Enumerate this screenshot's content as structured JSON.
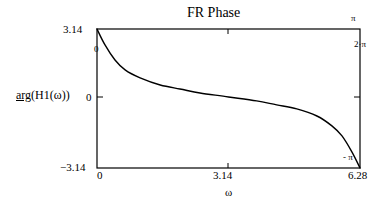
{
  "chart_data": {
    "type": "line",
    "title": "FR Phase",
    "xlabel": "ω",
    "ylabel_fn": "arg",
    "ylabel_arg": "(H1(ω))",
    "xlim": [
      0,
      6.28
    ],
    "ylim": [
      -3.14,
      3.14
    ],
    "grid": false,
    "x_ticks": [
      "0",
      "3.14",
      "6.28"
    ],
    "y_ticks": [
      "3.14",
      "0",
      "-3.14"
    ],
    "markers": {
      "top_right": "π",
      "right_upper": "2·π",
      "left_upper": "0",
      "bottom_right": "- π"
    },
    "series": [
      {
        "name": "arg(H1(ω))",
        "x": [
          0,
          0.19,
          0.43,
          0.67,
          1.03,
          1.51,
          1.98,
          2.46,
          3.14,
          3.81,
          4.29,
          4.77,
          5.25,
          5.61,
          5.85,
          6.09,
          6.28
        ],
        "y": [
          3.14,
          2.42,
          1.74,
          1.29,
          0.93,
          0.61,
          0.43,
          0.25,
          0.07,
          -0.11,
          -0.29,
          -0.47,
          -0.79,
          -1.24,
          -1.69,
          -2.42,
          -3.14
        ]
      }
    ]
  },
  "labels": {
    "title": "FR Phase",
    "y_top": "3.14",
    "y_zero": "0",
    "y_bottom": "−3.14",
    "x_left": "0",
    "x_mid": "3.14",
    "x_right": "6.28",
    "x_axis": "ω",
    "y_axis_fn": "arg",
    "y_axis_arg": "(H1(ω))",
    "marker_pi": "π",
    "marker_2pi": "2·π",
    "marker_zero": "0",
    "marker_neg_pi": "- π"
  },
  "colors": {
    "line": "#000000",
    "frame": "#000000",
    "background": "#ffffff"
  }
}
